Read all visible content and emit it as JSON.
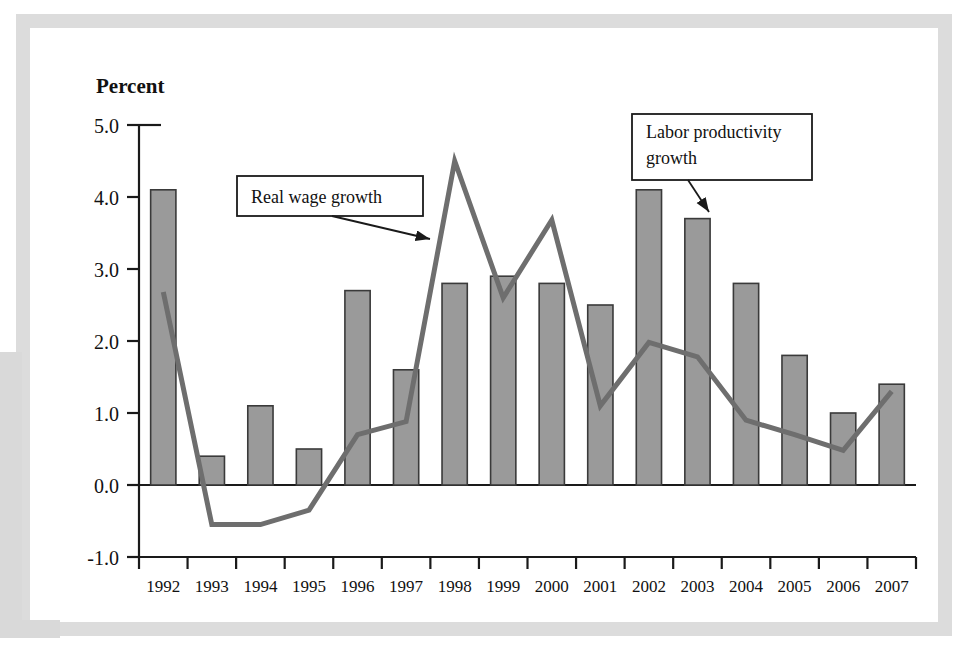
{
  "chart_data": {
    "type": "bar",
    "title": "",
    "xlabel": "",
    "ylabel": "Percent",
    "ylim": [
      -1.0,
      5.0
    ],
    "ytick_labels": [
      "5.0",
      "4.0",
      "3.0",
      "2.0",
      "1.0",
      "0.0",
      "-1.0"
    ],
    "ytick_values": [
      5.0,
      4.0,
      3.0,
      2.0,
      1.0,
      0.0,
      -1.0
    ],
    "grid": false,
    "legend_position": "annotations",
    "categories": [
      "1992",
      "1993",
      "1994",
      "1995",
      "1996",
      "1997",
      "1998",
      "1999",
      "2000",
      "2001",
      "2002",
      "2003",
      "2004",
      "2005",
      "2006",
      "2007"
    ],
    "series": [
      {
        "name": "Real wage growth",
        "render": "bar",
        "color": "#9a9a9a",
        "edge_color": "#3a3a3a",
        "values": [
          4.1,
          0.4,
          1.1,
          0.5,
          2.7,
          1.6,
          2.8,
          2.9,
          2.8,
          2.5,
          4.1,
          3.7,
          2.8,
          1.8,
          1.0,
          1.4
        ]
      },
      {
        "name": "Labor productivity growth",
        "render": "line",
        "color": "#6e6e6e",
        "values": [
          2.68,
          -0.55,
          -0.55,
          -0.35,
          0.7,
          0.88,
          4.5,
          2.6,
          3.68,
          1.1,
          1.98,
          1.78,
          0.9,
          0.7,
          0.48,
          1.3
        ]
      }
    ],
    "annotations": [
      {
        "id": "real-wage-growth",
        "lines": [
          "Real wage growth"
        ],
        "box": {
          "x": 237,
          "y": 176,
          "width": 186,
          "height": 40
        },
        "arrow": {
          "x1": 332,
          "y1": 216,
          "x2": 430,
          "y2": 239
        },
        "points_to_year": "1998",
        "points_to_series": "Real wage growth"
      },
      {
        "id": "labor-productivity-growth",
        "lines": [
          "Labor productivity",
          "growth"
        ],
        "box": {
          "x": 632,
          "y": 114,
          "width": 180,
          "height": 66
        },
        "arrow": {
          "x1": 688,
          "y1": 180,
          "x2": 709,
          "y2": 212
        },
        "points_to_year": "2003",
        "points_to_series": "Labor productivity growth"
      }
    ]
  },
  "axis": {
    "y_title": "Percent"
  },
  "colors": {
    "bar_fill": "#9a9a9a",
    "bar_edge": "#3a3a3a",
    "line": "#6e6e6e",
    "axis": "#1a1a1a",
    "frame": "#dcdcdc",
    "text": "#111111"
  }
}
